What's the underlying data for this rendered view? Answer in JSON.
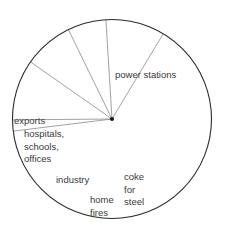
{
  "chart_data": {
    "type": "pie",
    "title": "",
    "subtitle": "",
    "xlabel": "",
    "ylabel": "",
    "legend_position": "none",
    "grid": false,
    "units": "share of coal use",
    "labels_inside_slices": true,
    "categories": [
      "power stations",
      "exports",
      "hospitals, schools, offices",
      "industry",
      "home fires",
      "coke for steel"
    ],
    "values": [
      55,
      2,
      10,
      12,
      11,
      10
    ],
    "slices": [
      {
        "name": "power-stations",
        "label": "power stations",
        "value": 55,
        "start_angle": 187.0,
        "end_angle": 450.5,
        "label_x": 115,
        "label_y": 78
      },
      {
        "name": "exports",
        "label": "exports",
        "value": 2,
        "start_angle": 180.5,
        "end_angle": 187.0,
        "label_x": 14,
        "label_y": 124
      },
      {
        "name": "hospitals-schools-offices",
        "label": "hospitals, schools, offices",
        "label_lines": [
          "hospitals,",
          "schools,",
          "offices"
        ],
        "value": 10,
        "start_angle": 145.0,
        "end_angle": 180.5,
        "label_x": 24,
        "label_y": 137
      },
      {
        "name": "industry",
        "label": "industry",
        "value": 12,
        "start_angle": 116.0,
        "end_angle": 145.0,
        "label_x": 56,
        "label_y": 183
      },
      {
        "name": "home-fires",
        "label": "home fires",
        "label_lines": [
          "home",
          "fires"
        ],
        "value": 11,
        "start_angle": 93.5,
        "end_angle": 116.0,
        "label_x": 90,
        "label_y": 203
      },
      {
        "name": "coke-for-steel",
        "label": "coke for steel",
        "label_lines": [
          "coke",
          "for",
          "steel"
        ],
        "value": 10,
        "start_angle": 59.0,
        "end_angle": 93.5,
        "label_x": 124,
        "label_y": 180
      }
    ],
    "geometry": {
      "center_x": 112,
      "center_y": 119,
      "radius": 99.5
    },
    "style": {
      "outline_color": "#2a2a2a",
      "divider_color": "#8a8a8a",
      "center_dot_color": "#1a1a1a",
      "text_color": "#3a3a3a",
      "background": "#ffffff"
    }
  }
}
